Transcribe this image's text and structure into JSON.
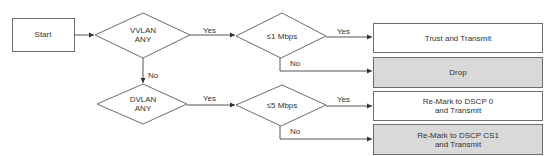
{
  "diagram": {
    "type": "flowchart",
    "start": {
      "label": "Start"
    },
    "decisions": [
      {
        "id": "vvlan",
        "line1": "VVLAN",
        "line2": "ANY"
      },
      {
        "id": "dvlan",
        "line1": "DVLAN",
        "line2": "ANY"
      },
      {
        "id": "rate1",
        "label": "≤1 Mbps"
      },
      {
        "id": "rate5",
        "label": "≤5 Mbps"
      }
    ],
    "edge_labels": {
      "vvlan_yes": "Yes",
      "vvlan_no": "No",
      "dvlan_yes": "Yes",
      "rate1_yes": "Yes",
      "rate1_no": "No",
      "rate5_yes": "Yes",
      "rate5_no": "No"
    },
    "actions": [
      {
        "id": "trust",
        "line1": "Trust and Transmit",
        "line2": "",
        "fill": "#ffffff"
      },
      {
        "id": "drop",
        "line1": "Drop",
        "line2": "",
        "fill": "#d9d9d9"
      },
      {
        "id": "remark0",
        "line1": "Re-Mark to DSCP 0",
        "line2": "and Transmit",
        "fill": "#ffffff"
      },
      {
        "id": "remarkcs1",
        "line1": "Re-Mark to DSCP CS1",
        "line2": "and Transmit",
        "fill": "#d9d9d9"
      }
    ],
    "colors": {
      "stroke": "#6d6d6d",
      "action_gray": "#d9d9d9",
      "text": "#333333"
    }
  }
}
